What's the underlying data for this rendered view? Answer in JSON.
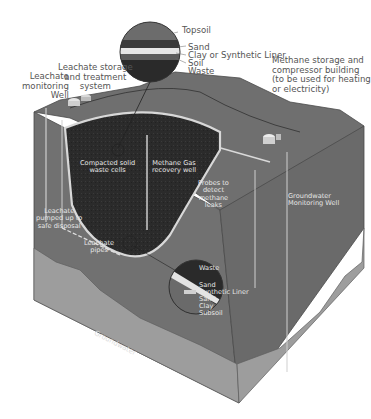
{
  "diagram": {
    "type": "cutaway",
    "colors": {
      "surface_top": "#6e6e6e",
      "front_face": "#707070",
      "right_face": "#6a6a6a",
      "waste_fill": "#2b2b2b",
      "liner": "#d8d8d8",
      "groundwater_band": "#9d9d9d",
      "label_text_dark": "#555555",
      "label_text_light": "#e6e6e6"
    },
    "cap_layers_callout": {
      "topsoil": "Topsoil",
      "sand": "Sand",
      "liner": "Clay or Synthetic Liner",
      "soil": "Soil",
      "waste": "Waste"
    },
    "labels": {
      "leachate_monitoring_well": "Leachate\nmonitoring\nWell",
      "leachate_storage": "Leachate storage\nand treatment\nsystem",
      "methane_storage": "Methane storage and\ncompressor building\n(to be used for heating\nor electricity)",
      "compacted_waste": "Compacted solid\nwaste cells",
      "methane_recovery_well": "Methane Gas\nrecovery well",
      "probes": "Probes to\ndetect\nmethane\nleaks",
      "groundwater_monitoring_well": "Groundwater\nMonitoring Well",
      "leachate_pumped": "Leachate\npumped up to\nsafe disposal",
      "leachate_pipes": "Leachate\npipes",
      "groundwater": "Groundwater"
    },
    "bottom_layers_callout": {
      "waste": "Waste",
      "sand1": "Sand",
      "liner": "Synthetic Liner",
      "sand2": "Sand",
      "clay": "Clay",
      "subsoil": "Subsoil"
    }
  }
}
